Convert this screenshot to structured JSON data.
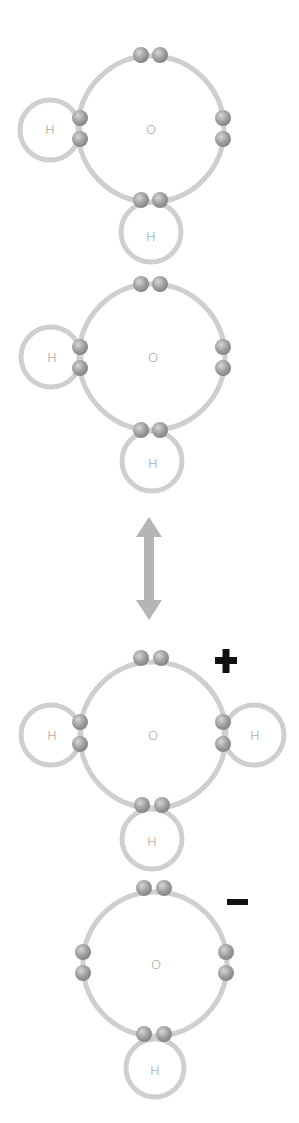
{
  "diagram": {
    "type": "water autoionization (Lewis electron-shell diagram)",
    "colors": {
      "shell": "#cfcfcf",
      "electron": "#9a9a9a",
      "electron_highlight": "#dcdcdc",
      "label": "#8a8a8a",
      "arrow": "#b5b5b5",
      "charge": "#111111"
    },
    "molecules": [
      {
        "name": "water-1",
        "center": {
          "label": "O"
        },
        "hydrogens": [
          {
            "label": "H",
            "position": "left"
          },
          {
            "label": "H",
            "position": "bottom"
          }
        ],
        "charge": ""
      },
      {
        "name": "water-2",
        "center": {
          "label": "O"
        },
        "hydrogens": [
          {
            "label": "H",
            "position": "left"
          },
          {
            "label": "H",
            "position": "bottom"
          }
        ],
        "charge": ""
      },
      {
        "name": "hydronium",
        "center": {
          "label": "O"
        },
        "hydrogens": [
          {
            "label": "H",
            "position": "left"
          },
          {
            "label": "H",
            "position": "right"
          },
          {
            "label": "H",
            "position": "bottom"
          }
        ],
        "charge": "+"
      },
      {
        "name": "hydroxide",
        "center": {
          "label": "O"
        },
        "hydrogens": [
          {
            "label": "H",
            "position": "bottom"
          }
        ],
        "charge": "−"
      }
    ],
    "arrow": {
      "type": "double-headed",
      "direction": "vertical"
    }
  }
}
